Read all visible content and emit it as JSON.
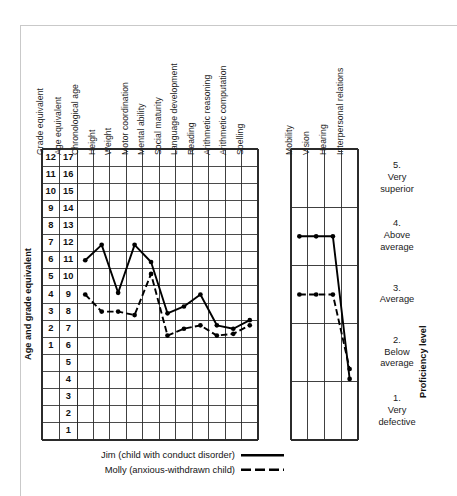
{
  "figure": {
    "left_axis_title": "Age and grade equivalent",
    "right_axis_title": "Proficiency level"
  },
  "scale": {
    "grade_header": "Grade equivalent",
    "age_header": "Age equivalent",
    "grade_values": [
      "12",
      "11",
      "10",
      "9",
      "8",
      "7",
      "6",
      "5",
      "4",
      "3",
      "2",
      "1",
      "",
      "",
      "",
      "",
      ""
    ],
    "age_values": [
      "17",
      "16",
      "15",
      "14",
      "13",
      "12",
      "11",
      "10",
      "9",
      "8",
      "7",
      "6",
      "5",
      "4",
      "3",
      "2",
      "1"
    ]
  },
  "legend": {
    "entries": [
      {
        "label": "Jim (child with conduct disorder)",
        "style": "solid"
      },
      {
        "label": "Molly (anxious-withdrawn child)",
        "style": "dashed"
      }
    ]
  },
  "proficiency_levels": [
    {
      "number": "5.",
      "line1": "Very",
      "line2": "superior"
    },
    {
      "number": "4.",
      "line1": "Above",
      "line2": "average"
    },
    {
      "number": "3.",
      "line1": "Average",
      "line2": ""
    },
    {
      "number": "2.",
      "line1": "Below",
      "line2": "average"
    },
    {
      "number": "1.",
      "line1": "Very",
      "line2": "defective"
    }
  ],
  "chart_data": {
    "type": "line",
    "title": "",
    "xlabel": "",
    "ylabel": "Age and grade equivalent",
    "panels": [
      {
        "name": "age-grade-panel",
        "categories": [
          "Chronological age",
          "Height",
          "Weight",
          "Motor coordination",
          "Mental ability",
          "Social maturity",
          "Language development",
          "Reading",
          "Arithmetic reasoning",
          "Arithmetic computation",
          "Spelling"
        ],
        "y_axis": {
          "label": "Age equivalent",
          "ticks": [
            17,
            16,
            15,
            14,
            13,
            12,
            11,
            10,
            9,
            8,
            7,
            6,
            5,
            4,
            3,
            2,
            1
          ],
          "ylim": [
            0.5,
            17.5
          ],
          "grid": true
        },
        "series": [
          {
            "name": "Jim (child with conduct disorder)",
            "style": "solid",
            "values": [
              11.0,
              11.9,
              9.1,
              11.9,
              10.9,
              7.9,
              8.3,
              9.0,
              7.2,
              7.0,
              7.5
            ]
          },
          {
            "name": "Molly (anxious-withdrawn child)",
            "style": "dashed",
            "values": [
              9.0,
              8.0,
              8.0,
              7.8,
              10.2,
              6.6,
              7.0,
              7.2,
              6.6,
              6.7,
              7.2
            ]
          }
        ]
      },
      {
        "name": "proficiency-panel",
        "categories": [
          "Mobility",
          "Vision",
          "Hearing",
          "Interpersonal relations"
        ],
        "y_axis": {
          "label": "Proficiency level",
          "ticks": [
            5,
            4,
            3,
            2,
            1
          ],
          "ylim": [
            0.5,
            5.5
          ],
          "grid": true
        },
        "series": [
          {
            "name": "Jim (child with conduct disorder)",
            "style": "solid",
            "values": [
              4.0,
              4.0,
              4.0,
              1.55
            ]
          },
          {
            "name": "Molly (anxious-withdrawn child)",
            "style": "dashed",
            "values": [
              3.0,
              3.0,
              3.0,
              1.72
            ]
          }
        ]
      }
    ]
  }
}
